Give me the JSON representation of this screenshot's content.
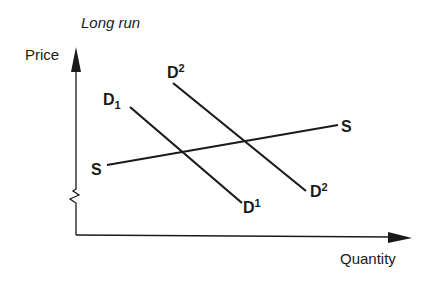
{
  "title": "Long run",
  "axes": {
    "y_label": "Price",
    "x_label": "Quantity"
  },
  "curves": {
    "supply": {
      "name": "S",
      "label_left": "S",
      "label_right": "S"
    },
    "demand_1": {
      "base": "D",
      "label_top_sub": "1",
      "label_bottom_sup": "1"
    },
    "demand_2": {
      "base": "D",
      "label_top_sup": "2",
      "label_bottom_sup": "2"
    }
  },
  "colors": {
    "ink": "#1a1a1a",
    "background": "#ffffff"
  }
}
